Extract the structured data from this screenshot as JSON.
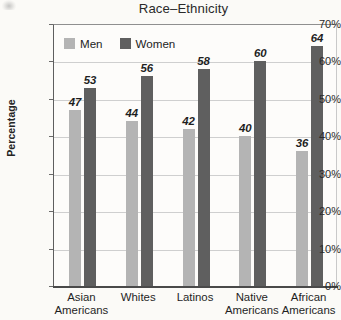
{
  "chart_data": {
    "type": "bar",
    "title": "Race–Ethnicity",
    "xlabel": "",
    "ylabel": "Percentage",
    "categories": [
      "Asian\nAmericans",
      "Whites",
      "Latinos",
      "Native\nAmericans",
      "African\nAmericans"
    ],
    "series": [
      {
        "name": "Men",
        "color": "#b4b4b4",
        "values": [
          47,
          44,
          42,
          40,
          36
        ]
      },
      {
        "name": "Women",
        "color": "#5f5f5f",
        "values": [
          53,
          56,
          58,
          60,
          64
        ]
      }
    ],
    "ylim": [
      0,
      70
    ],
    "ytick_labels": [
      "70%",
      "60%",
      "50%",
      "40%",
      "30%",
      "20%",
      "10%",
      "0%"
    ],
    "ytick_values": [
      70,
      60,
      50,
      40,
      30,
      20,
      10,
      0
    ],
    "grid": true,
    "legend_position": "top-left-inside",
    "value_labels_shown": true
  }
}
